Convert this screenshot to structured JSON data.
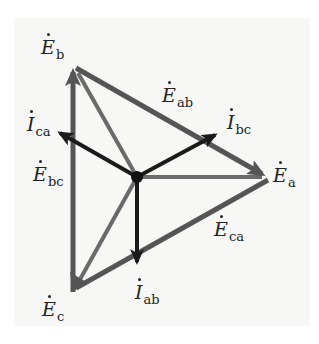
{
  "diagram": {
    "type": "phasor-diagram",
    "colors": {
      "background": "#f7f7f6",
      "line_voltage": "#555555",
      "phase_voltage": "#6a6a6a",
      "current": "#1a1a1a",
      "label": "#222222"
    },
    "nodes": {
      "neutral": {
        "x": 137,
        "y": 177
      },
      "a": {
        "x": 268,
        "y": 177
      },
      "b": {
        "x": 73,
        "y": 65
      },
      "c": {
        "x": 73,
        "y": 290
      }
    },
    "labels": {
      "Ea": {
        "symbol": "E",
        "sub": "a"
      },
      "Eb": {
        "symbol": "E",
        "sub": "b"
      },
      "Ec": {
        "symbol": "E",
        "sub": "c"
      },
      "Eab": {
        "symbol": "E",
        "sub": "ab"
      },
      "Ebc": {
        "symbol": "E",
        "sub": "bc"
      },
      "Eca": {
        "symbol": "E",
        "sub": "ca"
      },
      "Iab": {
        "symbol": "I",
        "sub": "ab"
      },
      "Ibc": {
        "symbol": "I",
        "sub": "bc"
      },
      "Ica": {
        "symbol": "I",
        "sub": "ca"
      }
    },
    "edges": [
      {
        "name": "E_ab",
        "from": "b",
        "to": "a",
        "kind": "line_voltage"
      },
      {
        "name": "E_ca",
        "from": "a",
        "to": "c",
        "kind": "line_voltage"
      },
      {
        "name": "E_bc",
        "from": "c",
        "to": "b",
        "kind": "line_voltage"
      },
      {
        "name": "E_a",
        "from": "neutral",
        "to": "a",
        "kind": "phase_voltage"
      },
      {
        "name": "E_b",
        "from": "neutral",
        "to": "b",
        "kind": "phase_voltage"
      },
      {
        "name": "E_c",
        "from": "neutral",
        "to": "c",
        "kind": "phase_voltage"
      },
      {
        "name": "I_bc",
        "from": "neutral",
        "to": [
          215,
          135
        ],
        "kind": "current"
      },
      {
        "name": "I_ca",
        "from": "neutral",
        "to": [
          60,
          133
        ],
        "kind": "current"
      },
      {
        "name": "I_ab",
        "from": "neutral",
        "to": [
          137,
          262
        ],
        "kind": "current"
      }
    ]
  }
}
